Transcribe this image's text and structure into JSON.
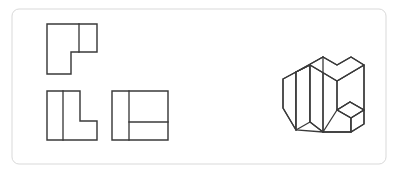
{
  "sheet": {
    "title": "Orthographic Views and Isometric Pictorial",
    "width": 405,
    "height": 175,
    "background_color": "#ffffff",
    "line_color": "#3a3a3a",
    "frame": {
      "label": "drawing-frame",
      "color": "#d9d9d9",
      "x": 12,
      "y": 9,
      "width": 374,
      "height": 155,
      "corner_radius": 7
    }
  },
  "views": {
    "top_view": {
      "label": "top-view",
      "description": "L-shaped outline with notch at lower right and a vertical division line",
      "outline_points": "47,24 97,24 97,52 71,52 71,74 47,74",
      "internal_lines": [
        {
          "label": "vertical-division",
          "x1": 79,
          "y1": 24,
          "x2": 79,
          "y2": 52
        }
      ]
    },
    "front_view": {
      "label": "front-view",
      "description": "L-shaped outline with notch at upper right and a vertical division line",
      "outline_points": "47,91 80,91 80,121 97,121 97,140 47,140",
      "internal_lines": [
        {
          "label": "vertical-division",
          "x1": 63,
          "y1": 91,
          "x2": 63,
          "y2": 140
        }
      ]
    },
    "side_view": {
      "label": "side-view",
      "description": "Square outline divided by a vertical line and a horizontal line on the right portion",
      "outline_points": "112,91 168,91 168,140 112,140",
      "internal_lines": [
        {
          "label": "vertical-division",
          "x1": 129,
          "y1": 91,
          "x2": 129,
          "y2": 140
        },
        {
          "label": "horizontal-division",
          "x1": 129,
          "y1": 122,
          "x2": 168,
          "y2": 122
        }
      ]
    },
    "isometric_view": {
      "label": "isometric-pictorial",
      "description": "Isometric pictorial of a stepped block: tall L-shaped upright with a low step projecting to the lower right",
      "faces": [
        {
          "label": "top-face",
          "points": "296,72 323,57 337,65 351,57 364,65 337,81 310,65"
        },
        {
          "label": "left-tall-face",
          "points": "283,79 296,72 296,100 283,108"
        },
        {
          "label": "front-tall-face",
          "points": "296,72 310,65 310,122 296,130"
        },
        {
          "label": "left-lower-face",
          "points": "283,79 296,100 296,130 283,108"
        },
        {
          "label": "inner-notch-face",
          "points": "310,65 323,57 323,89 310,97"
        },
        {
          "label": "right-tall-face",
          "points": "337,81 364,65 364,94 337,110"
        },
        {
          "label": "step-top-face",
          "points": "337,110 350,102 364,110 351,118"
        },
        {
          "label": "step-front-face",
          "points": "323,105 337,97 337,124 323,132"
        },
        {
          "label": "step-right-face",
          "points": "351,118 364,110 364,124 351,132"
        }
      ],
      "edges": [
        {
          "label": "edge-top-back-left",
          "x1": 296,
          "y1": 72,
          "x2": 323,
          "y2": 57
        },
        {
          "label": "edge-top-notch-right",
          "x1": 323,
          "y1": 57,
          "x2": 337,
          "y2": 65
        },
        {
          "label": "edge-top-notch-up",
          "x1": 337,
          "y1": 65,
          "x2": 351,
          "y2": 57
        },
        {
          "label": "edge-top-back-right",
          "x1": 351,
          "y1": 57,
          "x2": 364,
          "y2": 65
        },
        {
          "label": "edge-top-front-right",
          "x1": 364,
          "y1": 65,
          "x2": 337,
          "y2": 81
        },
        {
          "label": "edge-top-front-left",
          "x1": 337,
          "y1": 81,
          "x2": 310,
          "y2": 65
        },
        {
          "label": "edge-top-left-close",
          "x1": 310,
          "y1": 65,
          "x2": 296,
          "y2": 72
        },
        {
          "label": "edge-vertical-far-left",
          "x1": 283,
          "y1": 79,
          "x2": 283,
          "y2": 108
        },
        {
          "label": "edge-vertical-left",
          "x1": 296,
          "y1": 72,
          "x2": 296,
          "y2": 130
        },
        {
          "label": "edge-vertical-front",
          "x1": 310,
          "y1": 65,
          "x2": 310,
          "y2": 122
        },
        {
          "label": "edge-vertical-notch",
          "x1": 323,
          "y1": 57,
          "x2": 323,
          "y2": 132
        },
        {
          "label": "edge-vertical-mid-right",
          "x1": 337,
          "y1": 81,
          "x2": 337,
          "y2": 124
        },
        {
          "label": "edge-vertical-far-right",
          "x1": 364,
          "y1": 65,
          "x2": 364,
          "y2": 124
        },
        {
          "label": "edge-top-left-slope",
          "x1": 283,
          "y1": 79,
          "x2": 296,
          "y2": 72
        },
        {
          "label": "edge-bottom-left-slope",
          "x1": 283,
          "y1": 108,
          "x2": 296,
          "y2": 130
        },
        {
          "label": "edge-bottom-front",
          "x1": 296,
          "y1": 130,
          "x2": 323,
          "y2": 132
        },
        {
          "label": "edge-step-top-left",
          "x1": 337,
          "y1": 110,
          "x2": 350,
          "y2": 102
        },
        {
          "label": "edge-step-top-right",
          "x1": 350,
          "y1": 102,
          "x2": 364,
          "y2": 110
        },
        {
          "label": "edge-step-front",
          "x1": 337,
          "y1": 110,
          "x2": 351,
          "y2": 118
        },
        {
          "label": "edge-step-bottom",
          "x1": 323,
          "y1": 132,
          "x2": 351,
          "y2": 132
        },
        {
          "label": "edge-step-vertical",
          "x1": 351,
          "y1": 118,
          "x2": 351,
          "y2": 132
        },
        {
          "label": "edge-step-bottom-right",
          "x1": 351,
          "y1": 132,
          "x2": 364,
          "y2": 124
        }
      ]
    }
  }
}
